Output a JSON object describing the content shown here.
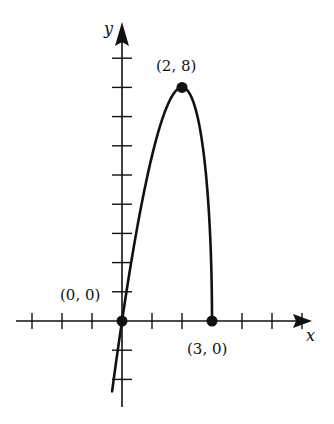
{
  "chart_data": {
    "type": "line",
    "title": "",
    "function_shape": "y = 4x*sqrt(3 - x)",
    "xlabel": "x",
    "ylabel": "y",
    "x_tick_count_negative": 3,
    "x_tick_count_positive": 6,
    "y_tick_count_positive": 9,
    "y_tick_count_negative": 3,
    "xlim": [
      -4,
      6.3
    ],
    "ylim": [
      -3,
      9.5
    ],
    "grid": false,
    "domain": [
      -0.33,
      3
    ],
    "series": [
      {
        "name": "curve",
        "x": [
          -0.33,
          0,
          0.5,
          1,
          1.5,
          2,
          2.5,
          2.8,
          2.95,
          3
        ],
        "y": [
          -2.4,
          0,
          3.16,
          5.66,
          7.35,
          8,
          7.07,
          5.01,
          2.64,
          0
        ]
      }
    ],
    "points": [
      {
        "x": 0,
        "y": 0,
        "label": "(0, 0)"
      },
      {
        "x": 2,
        "y": 8,
        "label": "(2, 8)"
      },
      {
        "x": 3,
        "y": 0,
        "label": "(3, 0)"
      }
    ],
    "annotations": [
      "(0, 0)",
      "(2, 8)",
      "(3, 0)"
    ]
  },
  "labels": {
    "x_axis": "x",
    "y_axis": "y",
    "origin": "(0, 0)",
    "max": "(2, 8)",
    "endpoint": "(3, 0)"
  },
  "style": {
    "ink": "#111111",
    "background": "#ffffff"
  }
}
